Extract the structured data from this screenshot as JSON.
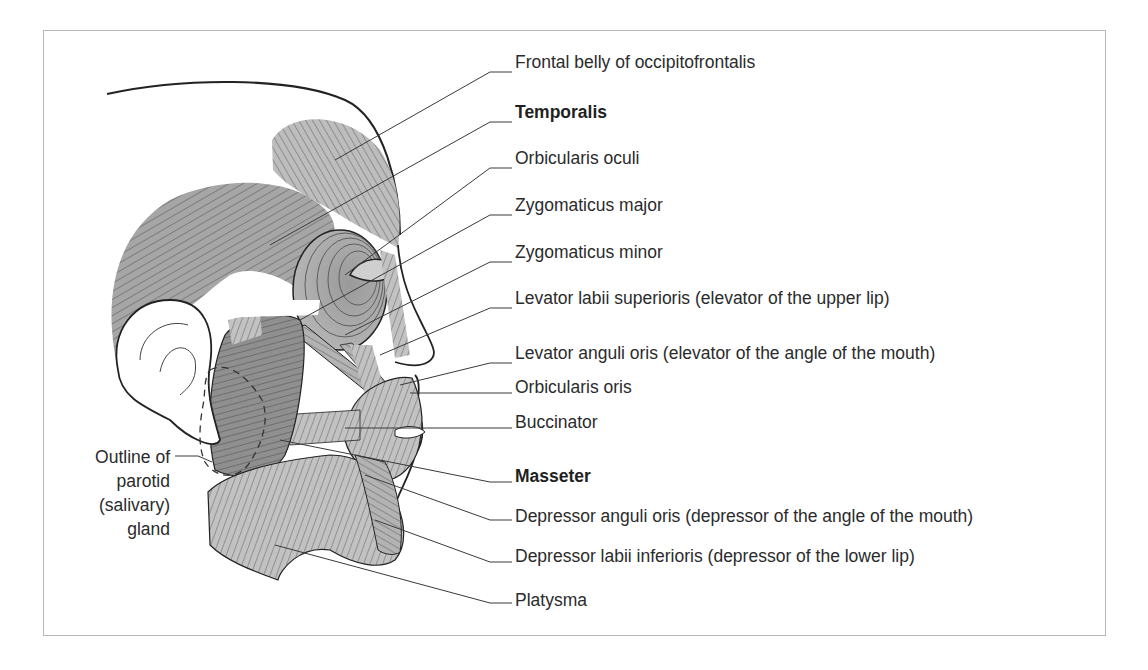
{
  "figure": {
    "labels": [
      {
        "id": "frontal-belly",
        "text": "Frontal belly of occipitofrontalis",
        "bold": false,
        "y": 62
      },
      {
        "id": "temporalis",
        "text": "Temporalis",
        "bold": true,
        "y": 112
      },
      {
        "id": "orbicularis-oculi",
        "text": "Orbicularis oculi",
        "bold": false,
        "y": 158
      },
      {
        "id": "zygomaticus-major",
        "text": "Zygomaticus major",
        "bold": false,
        "y": 205
      },
      {
        "id": "zygomaticus-minor",
        "text": "Zygomaticus minor",
        "bold": false,
        "y": 252
      },
      {
        "id": "levator-labii-superioris",
        "text": "Levator labii superioris (elevator of the upper lip)",
        "bold": false,
        "y": 298
      },
      {
        "id": "levator-anguli-oris",
        "text": "Levator anguli oris (elevator of the angle of the mouth)",
        "bold": false,
        "y": 353
      },
      {
        "id": "orbicularis-oris",
        "text": "Orbicularis oris",
        "bold": false,
        "y": 387
      },
      {
        "id": "buccinator",
        "text": "Buccinator",
        "bold": false,
        "y": 422
      },
      {
        "id": "masseter",
        "text": "Masseter",
        "bold": true,
        "y": 476
      },
      {
        "id": "depressor-anguli-oris",
        "text": "Depressor anguli oris (depressor of the angle of the mouth)",
        "bold": false,
        "y": 516
      },
      {
        "id": "depressor-labii-inferioris",
        "text": "Depressor labii inferioris (depressor of the lower lip)",
        "bold": false,
        "y": 556
      },
      {
        "id": "platysma",
        "text": "Platysma",
        "bold": false,
        "y": 600
      }
    ],
    "side_label": {
      "lines": [
        "Outline of",
        "parotid",
        "(salivary)",
        "gland"
      ]
    },
    "colors": {
      "muscle_light": "#c4c4c4",
      "muscle_mid": "#a9a9a9",
      "muscle_dark": "#8f8f8f",
      "outline": "#1e1e1e",
      "leader": "#3a3a3a",
      "frame": "#b8b8b8"
    }
  }
}
